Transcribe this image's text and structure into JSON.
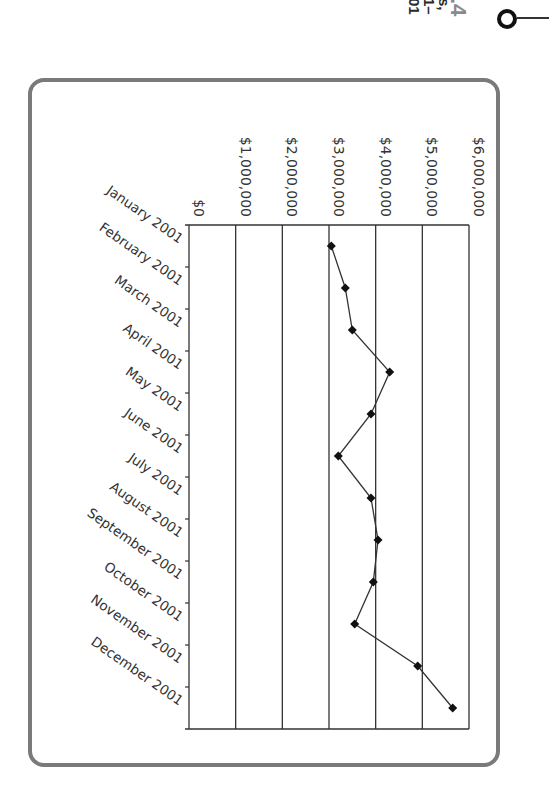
{
  "caption_fragments": {
    "number": ".4",
    "line1": "s,",
    "line2": "1–",
    "line3": "01"
  },
  "chart_data": {
    "type": "line",
    "orientation": "rotated 90deg clockwise (months run top-to-bottom, values increase left-to-right)",
    "title": "",
    "xlabel": "",
    "ylabel": "",
    "categories": [
      "January 2001",
      "February 2001",
      "March 2001",
      "April 2001",
      "May 2001",
      "June 2001",
      "July 2001",
      "August 2001",
      "September 2001",
      "October 2001",
      "November 2001",
      "December 2001"
    ],
    "series": [
      {
        "name": "Monthly total",
        "marker": "diamond",
        "color": "#111111",
        "values": [
          3050000,
          3350000,
          3500000,
          4300000,
          3900000,
          3200000,
          3900000,
          4050000,
          3950000,
          3550000,
          4900000,
          5650000
        ]
      }
    ],
    "ylim": [
      0,
      6000000
    ],
    "yticks": [
      0,
      1000000,
      2000000,
      3000000,
      4000000,
      5000000,
      6000000
    ],
    "ytick_labels": [
      "$0",
      "$1,000,000",
      "$2,000,000",
      "$3,000,000",
      "$4,000,000",
      "$5,000,000",
      "$6,000,000"
    ],
    "grid": true,
    "legend": "none"
  }
}
